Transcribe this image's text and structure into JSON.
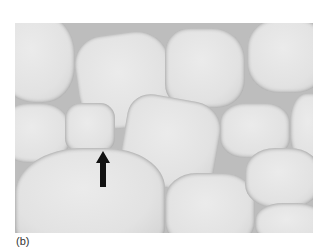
{
  "figure": {
    "panel_label": "(b)",
    "image_description": "grayscale micrograph of adipose tissue with large polygonal fat cells",
    "arrow": {
      "direction": "up",
      "color": "#111111"
    }
  }
}
